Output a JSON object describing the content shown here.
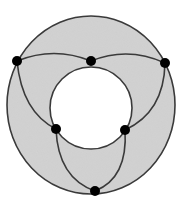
{
  "title": "Annulus graph with six vertices",
  "colors": {
    "fill": "#d3d3d3",
    "stroke": "#3a3a3a",
    "vertex": "#000000",
    "hole": "#ffffff"
  },
  "outer_circle": {
    "cx": 91,
    "cy": 105,
    "rx": 84,
    "ry": 89
  },
  "inner_circle": {
    "cx": 91,
    "cy": 108,
    "r": 41
  },
  "vertices": [
    {
      "id": "A",
      "x": 17,
      "y": 61
    },
    {
      "id": "B",
      "x": 91,
      "y": 61
    },
    {
      "id": "C",
      "x": 165,
      "y": 63
    },
    {
      "id": "D",
      "x": 56,
      "y": 129
    },
    {
      "id": "E",
      "x": 125,
      "y": 130
    },
    {
      "id": "F",
      "x": 95,
      "y": 191
    }
  ],
  "edges": [
    {
      "from": "A",
      "to": "B",
      "path": "M17,61 Q54,46 91,61"
    },
    {
      "from": "B",
      "to": "C",
      "path": "M91,61 Q128,46 165,63"
    },
    {
      "from": "A",
      "to": "D",
      "path": "M17,61 Q22,112 56,129"
    },
    {
      "from": "C",
      "to": "E",
      "path": "M165,63 Q164,112 125,130"
    },
    {
      "from": "D",
      "to": "F",
      "path": "M56,129 Q58,178 95,191"
    },
    {
      "from": "E",
      "to": "F",
      "path": "M125,130 Q128,178 95,191"
    }
  ]
}
